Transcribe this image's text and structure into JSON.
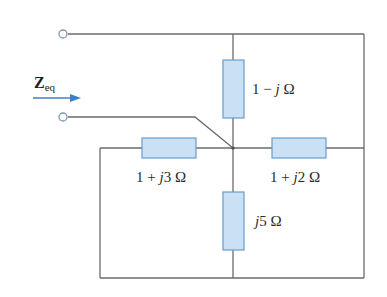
{
  "diagram": {
    "type": "circuit",
    "input_label": {
      "symbol": "Z",
      "subscript": "eq"
    },
    "components": [
      {
        "id": "Z_top",
        "label_pre": "1 − ",
        "label_j": "j",
        "label_post": " Ω",
        "orientation": "vertical",
        "position": "center-top"
      },
      {
        "id": "Z_left",
        "label_pre": "1 + ",
        "label_j": "j",
        "label_post": "3 Ω",
        "orientation": "horizontal",
        "position": "left-middle"
      },
      {
        "id": "Z_right",
        "label_pre": "1 + ",
        "label_j": "j",
        "label_post": "2 Ω",
        "orientation": "horizontal",
        "position": "right-middle"
      },
      {
        "id": "Z_bottom",
        "label_pre": "",
        "label_j": "j",
        "label_post": "5 Ω",
        "orientation": "vertical",
        "position": "center-bottom"
      }
    ],
    "terminals": [
      {
        "id": "terminal_top"
      },
      {
        "id": "terminal_bottom"
      }
    ],
    "colors": {
      "wire": "#6b6b6b",
      "resistor_fill": "#c9e0f5",
      "resistor_stroke": "#6a9bc9",
      "arrow": "#3f7fc8"
    }
  }
}
